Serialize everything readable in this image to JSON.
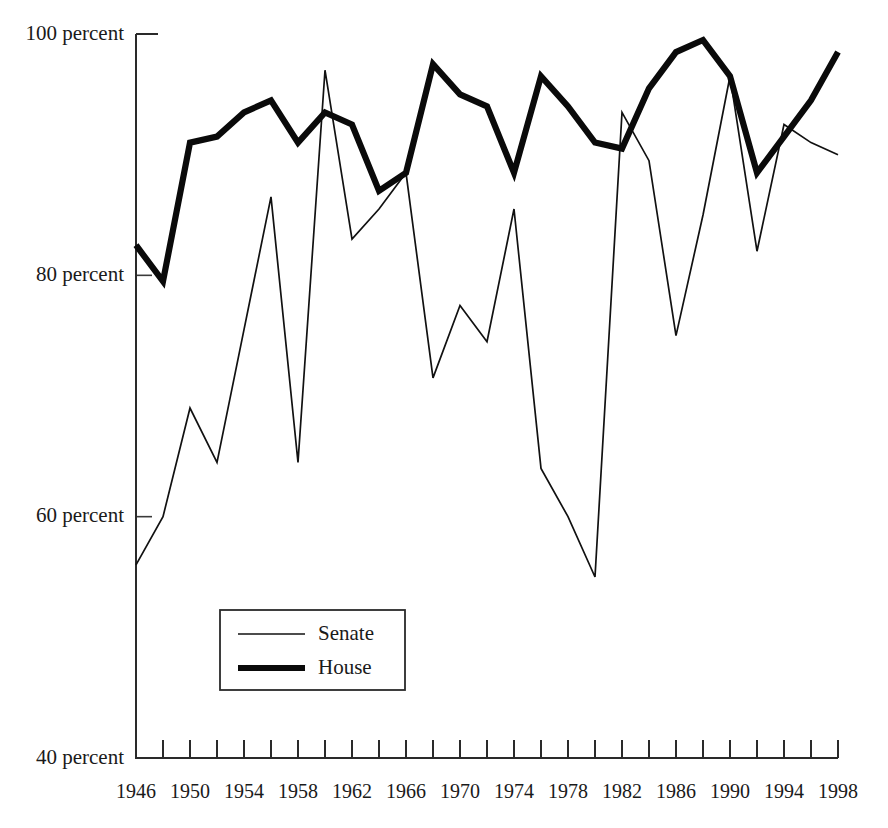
{
  "chart_data": {
    "type": "line",
    "title": "",
    "subtitle": "",
    "xlabel": "",
    "ylabel": "",
    "xlim": [
      1946,
      1998
    ],
    "ylim": [
      40,
      100
    ],
    "grid": false,
    "legend_position": "inner-bottom-left",
    "y_tick_labels": [
      "100 percent",
      "80 percent",
      "60 percent",
      "40 percent"
    ],
    "y_tick_values": [
      100,
      80,
      60,
      40
    ],
    "x_tick_values": [
      1946,
      1948,
      1950,
      1952,
      1954,
      1956,
      1958,
      1960,
      1962,
      1964,
      1966,
      1968,
      1970,
      1972,
      1974,
      1976,
      1978,
      1980,
      1982,
      1984,
      1986,
      1988,
      1990,
      1992,
      1994,
      1996,
      1998
    ],
    "x_tick_labels": [
      "1946",
      "",
      "1950",
      "",
      "1954",
      "",
      "1958",
      "",
      "1962",
      "",
      "1966",
      "",
      "1970",
      "",
      "1974",
      "",
      "1978",
      "",
      "1982",
      "",
      "1986",
      "",
      "1990",
      "",
      "1994",
      "",
      "1998"
    ],
    "x": [
      1946,
      1948,
      1950,
      1952,
      1954,
      1956,
      1958,
      1960,
      1962,
      1964,
      1966,
      1968,
      1970,
      1972,
      1974,
      1976,
      1978,
      1980,
      1982,
      1984,
      1986,
      1988,
      1990,
      1992,
      1994,
      1996,
      1998
    ],
    "series": [
      {
        "name": "Senate",
        "line_style": "thin",
        "color": "#111111",
        "values": [
          56.0,
          60.0,
          69.0,
          64.5,
          75.5,
          86.5,
          64.5,
          97.0,
          83.0,
          85.5,
          88.5,
          71.5,
          77.5,
          74.5,
          85.5,
          64.0,
          60.0,
          55.0,
          93.5,
          89.5,
          75.0,
          85.0,
          96.5,
          82.0,
          92.5,
          91.0,
          90.0
        ]
      },
      {
        "name": "House",
        "line_style": "thick",
        "color": "#0a0a0a",
        "values": [
          82.5,
          79.5,
          91.0,
          91.5,
          93.5,
          94.5,
          91.0,
          93.5,
          92.5,
          87.0,
          88.5,
          97.5,
          95.0,
          94.0,
          88.5,
          96.5,
          94.0,
          91.0,
          90.5,
          95.5,
          98.5,
          99.5,
          96.5,
          88.5,
          91.5,
          94.5,
          98.5
        ]
      }
    ]
  },
  "legend": {
    "entries": [
      {
        "label": "Senate",
        "style": "thin-line"
      },
      {
        "label": "House",
        "style": "thick-line"
      }
    ]
  }
}
